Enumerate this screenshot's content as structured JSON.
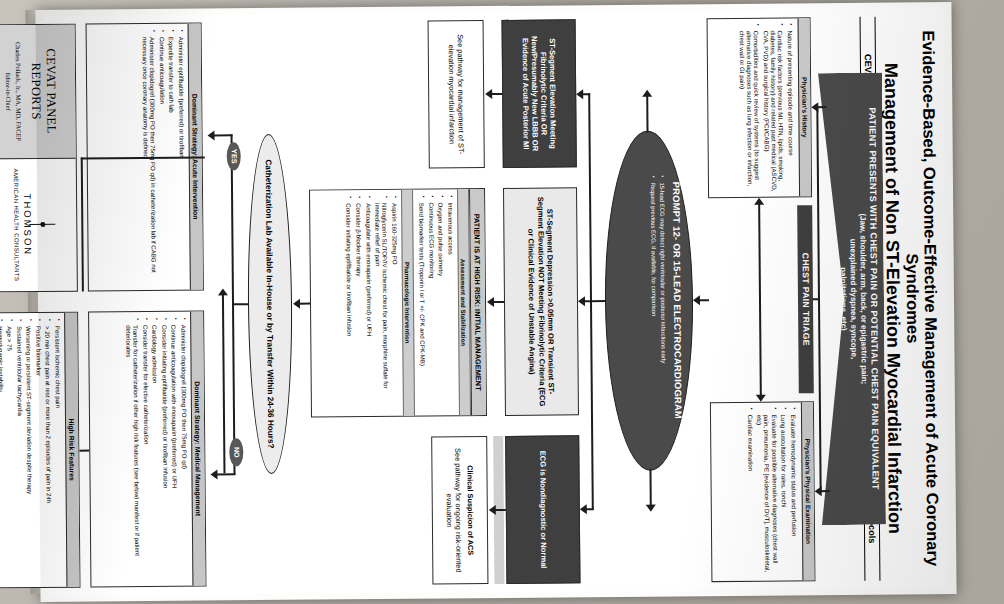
{
  "poster": {
    "title_line1": "Evidence-Based, Outcome-Effective Management of Acute Coronary Syndromes",
    "title_line2": "Management of Non ST-Elevation Myocardial Infarction",
    "subtitle": "CEVAT (Centers of Excellence in Venous and Arterial Thrombosis) Leadership Council Guidelines and Protocols"
  },
  "entry_banner": {
    "line1": "PATIENT PRESENTS WITH CHEST PAIN OR POTENTIAL CHEST PAIN EQUIVALENT",
    "line2": "(Jaw, shoulder, arm, back, or epigastric pain;",
    "line3": "unexplained dyspnea, syncope,",
    "line4": "palpitations, etc)"
  },
  "triage": {
    "banner": "CHEST PAIN TRIAGE",
    "history": {
      "header": "Physician's History",
      "items": [
        "Nature of presenting episode and time course",
        "Cardiac risk factors (previous MI, HTN, lipids, smoking, diabetes, family history) and related past medical (ASCVD, CVA, PVD) and surgical history (PCI/CABG)",
        "Comorbidities and quick review of systems (to suggest alternative diagnoses such as lung infection or infarction, chest wall or GI pain)"
      ]
    },
    "physical": {
      "header": "Physician's Physical Examination",
      "items": [
        "Evaluate hemodynamic status and perfusion",
        "Lung auscultation for rales, ronchi",
        "Evaluate for possible alternative diagnoses (chest wall pain, pneumonia, PE [evidence of DVT], musculoskeletal, etc)",
        "Cardiac examination"
      ]
    }
  },
  "prompt": {
    "title": "PROMPT 12- OR 15-LEAD ELECTROCARDIOGRAM",
    "items": [
      "15-lead ECG may detect right ventricular or posterior infarctions early",
      "Request previous ECG, if available, for comparison"
    ]
  },
  "outcomes": [
    {
      "id": "st-elevation",
      "label": "ST-Segment Elevation Meeting Fibrinolytic Criteria OR New/Presumably New LBBB OR Evidence of Acute Posterior MI",
      "pathway": "See pathway for management of ST-elevation myocardial infarction"
    },
    {
      "id": "st-depression",
      "label": "ST-Segment Depression >0.05mm OR Transient ST-Segment Elevation NOT Meeting Fibrinolytic Criteria (ECG or Clinical Evidence of Unstable Angina)"
    },
    {
      "id": "nondiagnostic",
      "label": "ECG is Nondiagnostic or Normal",
      "pathway": "See pathway for ongoing risk-oriented evaluation",
      "extra_label": "Clinical Suspicion of ACS"
    }
  ],
  "high_risk": {
    "title": "PATIENT IS AT HIGH RISK: INITIAL MANAGEMENT",
    "sections": [
      {
        "header": "Assessment and Stabilization",
        "items": [
          "Intravenous access",
          "Oxygen and pulse oximetry",
          "Continuous ECG monitoring",
          "Send biomarker tests (Troponin I or T +/- CPK and CPK-MB)"
        ]
      },
      {
        "header": "Pharmacologic Intervention",
        "items": [
          "Aspirin 160-325mg PO",
          "Nitroglycerin SL/TOP/IV ischemic chest for pain, morphine sulfate for immediate relief of pain",
          "Anticoagulate with enoxaparin (preferred) or UFH",
          "Consider β-blocker therapy",
          "Consider initiating eptifibatide or tirofiban infusion"
        ]
      }
    ]
  },
  "decision": {
    "question": "Catheterization Lab Available In-House or by Transfer Within 24-36 Hours?",
    "yes": "YES",
    "no": "NO"
  },
  "branch_yes": {
    "header": "Dominant Strategy: Acute Intervention",
    "items": [
      "Administer eptifibatide (preferred) or tirofiban",
      "Expedite transfer to cath lab",
      "Continue anticoagulation",
      "Administer clopidogrel (300mg PO then 75mg PO qd) in catheterization lab if CABG not necessary once coronary anatomy is defined"
    ]
  },
  "branch_no": {
    "header": "Dominant Strategy: Medical Management",
    "items": [
      "Administer clopidogrel (300mg PO then 75mg PO qd)",
      "Continue anticoagulation with enoxaparin (preferred) or UFH",
      "Consider initiating eptifibatide (preferred) or tirofiban infusion",
      "Cardiology admission",
      "Consider transfer for elective catheterization",
      "Transfer for catheterization if other high risk features (see below) manifest or if patient deteriorates"
    ]
  },
  "high_risk_features": {
    "header": "High Risk Features",
    "items": [
      "Persistent ischemic chest pain",
      "> 20 min chest pain at rest or more than 2 episodes of pain in 24h",
      "Positive biomarker",
      "Worsening or persistent ST-segment deviation despite therapy",
      "Sustained ventricular tachycardia",
      "Age > 75",
      "Hemodynamic instability",
      "Signs of pump failure (rales, new MR, murmur, new S3 gallop)"
    ]
  },
  "credit": {
    "series": "CEVAT PANEL REPORTS",
    "editor": "Charles Pollack, Jr., MA, MD, FACEP",
    "editor_role": "Editor-in-Chief",
    "publisher": "THOMSON",
    "publisher_sub": "AMERICAN HEALTH CONSULTANTS"
  },
  "colors": {
    "dark_box": "#3f3f3f",
    "banner": "#4a4a4a",
    "grey_header": "#c9c9c9",
    "light_fill": "#e9e9e9",
    "line": "#1d1d1d"
  }
}
